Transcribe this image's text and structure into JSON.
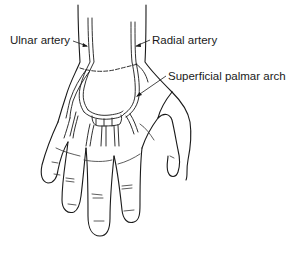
{
  "figure": {
    "labels": [
      {
        "id": "ulnar",
        "text": "Ulnar artery"
      },
      {
        "id": "radial",
        "text": "Radial artery"
      },
      {
        "id": "arch",
        "text": "Superficial palmar arch"
      }
    ],
    "colors": {
      "line": "#1a1a1a",
      "background": "#ffffff"
    }
  }
}
